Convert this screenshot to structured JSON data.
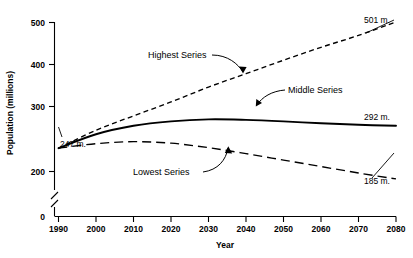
{
  "chart_data": {
    "type": "line",
    "title": "",
    "xlabel": "Year",
    "ylabel": "Population (millions)",
    "xlim": [
      1990,
      2080
    ],
    "ylim": [
      180,
      520
    ],
    "grid": false,
    "legend_position": "inline-annotations",
    "axis_break_y": true,
    "y_zero_shown": true,
    "xticks": [
      "1990",
      "2000",
      "2010",
      "2020",
      "2030",
      "2040",
      "2050",
      "2060",
      "2070",
      "2080"
    ],
    "yticks": [
      "0",
      "200",
      "300",
      "400",
      "500"
    ],
    "x": [
      1990,
      2000,
      2010,
      2020,
      2030,
      2040,
      2050,
      2060,
      2070,
      2080
    ],
    "series": [
      {
        "name": "Highest Series",
        "style": "short-dashed",
        "values": [
          247,
          283,
          312,
          340,
          370,
          397,
          424,
          450,
          474,
          501
        ],
        "end_label": "501 m."
      },
      {
        "name": "Middle Series",
        "style": "solid",
        "values": [
          247,
          275,
          292,
          301,
          305,
          304,
          301,
          297,
          294,
          292
        ],
        "end_label": "292 m."
      },
      {
        "name": "Lowest Series",
        "style": "long-dashed",
        "values": [
          247,
          256,
          260,
          257,
          248,
          236,
          223,
          210,
          197,
          185
        ],
        "end_label": "185 m."
      }
    ],
    "annotations": [
      {
        "text": "Highest Series",
        "kind": "series-callout"
      },
      {
        "text": "Middle Series",
        "kind": "series-callout"
      },
      {
        "text": "Lowest Series",
        "kind": "series-callout"
      },
      {
        "text": "247 m.",
        "kind": "start-value"
      },
      {
        "text": "501 m.",
        "kind": "end-value"
      },
      {
        "text": "292 m.",
        "kind": "end-value"
      },
      {
        "text": "185 m.",
        "kind": "end-value"
      }
    ]
  },
  "axes": {
    "y_title": "Population (millions)",
    "x_title": "Year",
    "y_ticks": [
      {
        "label": "500"
      },
      {
        "label": "400"
      },
      {
        "label": "300"
      },
      {
        "label": "200"
      },
      {
        "label": "0"
      }
    ],
    "x_ticks": [
      {
        "label": "1990"
      },
      {
        "label": "2000"
      },
      {
        "label": "2010"
      },
      {
        "label": "2020"
      },
      {
        "label": "2030"
      },
      {
        "label": "2040"
      },
      {
        "label": "2050"
      },
      {
        "label": "2060"
      },
      {
        "label": "2070"
      },
      {
        "label": "2080"
      }
    ]
  },
  "labels": {
    "highest_series": "Highest Series",
    "middle_series": "Middle Series",
    "lowest_series": "Lowest Series",
    "start_value": "247 m.",
    "highest_end": "501 m.",
    "middle_end": "292 m.",
    "lowest_end": "185 m."
  },
  "colors": {
    "ink": "#000000",
    "background": "#ffffff"
  }
}
